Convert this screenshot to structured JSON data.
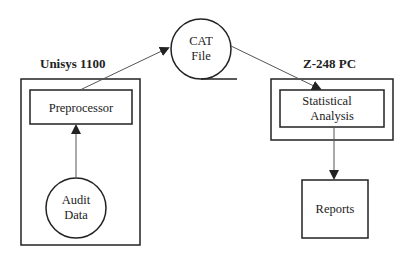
{
  "diagram": {
    "type": "data-flow",
    "systems": [
      {
        "id": "unisys",
        "label": "Unisys 1100"
      },
      {
        "id": "z248",
        "label": "Z-248 PC"
      }
    ],
    "nodes": {
      "audit_data": {
        "line1": "Audit",
        "line2": "Data",
        "shape": "circle"
      },
      "preprocessor": {
        "label": "Preprocessor",
        "shape": "rectangle"
      },
      "cat_file": {
        "line1": "CAT",
        "line2": "File",
        "shape": "tape-circle"
      },
      "statistical_analysis": {
        "line1": "Statistical",
        "line2": "Analysis",
        "shape": "rectangle"
      },
      "reports": {
        "label": "Reports",
        "shape": "rectangle"
      }
    },
    "edges": [
      {
        "from": "Audit Data",
        "to": "Preprocessor"
      },
      {
        "from": "Preprocessor",
        "to": "CAT File"
      },
      {
        "from": "CAT File",
        "to": "Statistical Analysis"
      },
      {
        "from": "Statistical Analysis",
        "to": "Reports"
      }
    ],
    "colors": {
      "stroke": "#222222",
      "background": "#ffffff"
    }
  }
}
